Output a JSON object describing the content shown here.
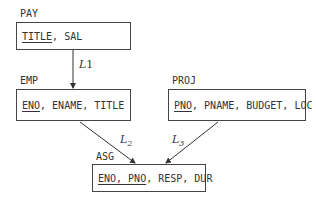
{
  "nodes": {
    "pay": {
      "name": "PAY",
      "key": "TITLE",
      "rest": ", SAL"
    },
    "emp": {
      "name": "EMP",
      "key": "ENO",
      "rest": ", ENAME, TITLE"
    },
    "proj": {
      "name": "PROJ",
      "key": "PNO",
      "rest": ", PNAME, BUDGET, LOC"
    },
    "asg": {
      "name": "ASG",
      "key": "ENO, PNO",
      "rest": ", RESP, DUR"
    }
  },
  "edges": {
    "l1": {
      "base": "L",
      "sub": "1"
    },
    "l2": {
      "base": "L",
      "sub": "2"
    },
    "l3": {
      "base": "L",
      "sub": "3"
    }
  }
}
